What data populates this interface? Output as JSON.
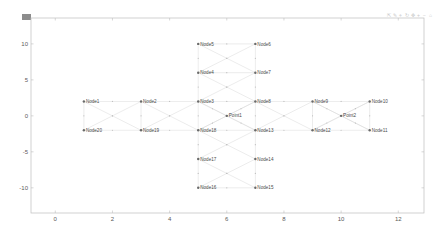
{
  "figure": {
    "grip_label": "",
    "toolbar": [
      {
        "icon": "export-icon",
        "glyph": "⇱"
      },
      {
        "icon": "brush-icon",
        "glyph": "✎"
      },
      {
        "icon": "datatip-icon",
        "glyph": "⌖"
      },
      {
        "icon": "rotate-icon",
        "glyph": "↻"
      },
      {
        "icon": "pan-icon",
        "glyph": "✥"
      },
      {
        "icon": "zoom-in-icon",
        "glyph": "+"
      },
      {
        "icon": "zoom-out-icon",
        "glyph": "−"
      },
      {
        "icon": "home-icon",
        "glyph": "⌂"
      }
    ]
  },
  "chart_data": {
    "type": "scatter",
    "subtype": "graph-network",
    "title": "",
    "xlabel": "",
    "ylabel": "",
    "xlim": [
      -0.85,
      12.9
    ],
    "ylim": [
      -13.5,
      13.6
    ],
    "xticks": [
      0,
      2,
      4,
      6,
      8,
      10,
      12
    ],
    "yticks": [
      10,
      5,
      0,
      -5,
      -10
    ],
    "xtick_labels": [
      "0",
      "2",
      "4",
      "6",
      "8",
      "10",
      "12"
    ],
    "ytick_labels": [
      "10",
      "5",
      "0",
      "-5",
      "-10"
    ],
    "grid": false,
    "legend": null,
    "nodes": [
      {
        "name": "Node1",
        "x": 1,
        "y": 2
      },
      {
        "name": "Node20",
        "x": 1,
        "y": -2
      },
      {
        "name": "Node2",
        "x": 3,
        "y": 2
      },
      {
        "name": "Node19",
        "x": 3,
        "y": -2
      },
      {
        "name": "Node3",
        "x": 5,
        "y": 2
      },
      {
        "name": "Node18",
        "x": 5,
        "y": -2
      },
      {
        "name": "Node4",
        "x": 5,
        "y": 6
      },
      {
        "name": "Node5",
        "x": 5,
        "y": 10
      },
      {
        "name": "Node6",
        "x": 7,
        "y": 10
      },
      {
        "name": "Node7",
        "x": 7,
        "y": 6
      },
      {
        "name": "Node8",
        "x": 7,
        "y": 2
      },
      {
        "name": "Node13",
        "x": 7,
        "y": -2
      },
      {
        "name": "Point1",
        "x": 6,
        "y": 0
      },
      {
        "name": "Node17",
        "x": 5,
        "y": -6
      },
      {
        "name": "Node16",
        "x": 5,
        "y": -10
      },
      {
        "name": "Node14",
        "x": 7,
        "y": -6
      },
      {
        "name": "Node15",
        "x": 7,
        "y": -10
      },
      {
        "name": "Node9",
        "x": 9,
        "y": 2
      },
      {
        "name": "Node12",
        "x": 9,
        "y": -2
      },
      {
        "name": "Point2",
        "x": 10,
        "y": 0
      },
      {
        "name": "Node10",
        "x": 11,
        "y": 2
      },
      {
        "name": "Node11",
        "x": 11,
        "y": -2
      }
    ],
    "edges": [
      [
        "Node1",
        "Node20"
      ],
      [
        "Node1",
        "Node2"
      ],
      [
        "Node1",
        "Node19"
      ],
      [
        "Node20",
        "Node2"
      ],
      [
        "Node20",
        "Node19"
      ],
      [
        "Node2",
        "Node19"
      ],
      [
        "Node2",
        "Node3"
      ],
      [
        "Node2",
        "Node18"
      ],
      [
        "Node19",
        "Node3"
      ],
      [
        "Node19",
        "Node18"
      ],
      [
        "Node3",
        "Node18"
      ],
      [
        "Node3",
        "Node4"
      ],
      [
        "Node3",
        "Node7"
      ],
      [
        "Node3",
        "Node8"
      ],
      [
        "Node3",
        "Point1"
      ],
      [
        "Node4",
        "Node5"
      ],
      [
        "Node4",
        "Node6"
      ],
      [
        "Node4",
        "Node7"
      ],
      [
        "Node4",
        "Node8"
      ],
      [
        "Node5",
        "Node6"
      ],
      [
        "Node5",
        "Node7"
      ],
      [
        "Node6",
        "Node7"
      ],
      [
        "Node7",
        "Node8"
      ],
      [
        "Node8",
        "Point1"
      ],
      [
        "Node8",
        "Node13"
      ],
      [
        "Node8",
        "Node18"
      ],
      [
        "Node8",
        "Node9"
      ],
      [
        "Node8",
        "Node12"
      ],
      [
        "Node18",
        "Point1"
      ],
      [
        "Node13",
        "Point1"
      ],
      [
        "Node18",
        "Node13"
      ],
      [
        "Node3",
        "Node13"
      ],
      [
        "Node18",
        "Node17"
      ],
      [
        "Node18",
        "Node14"
      ],
      [
        "Node13",
        "Node17"
      ],
      [
        "Node13",
        "Node14"
      ],
      [
        "Node17",
        "Node16"
      ],
      [
        "Node17",
        "Node15"
      ],
      [
        "Node14",
        "Node16"
      ],
      [
        "Node14",
        "Node15"
      ],
      [
        "Node16",
        "Node15"
      ],
      [
        "Node13",
        "Node9"
      ],
      [
        "Node13",
        "Node12"
      ],
      [
        "Node9",
        "Node12"
      ],
      [
        "Node9",
        "Point2"
      ],
      [
        "Node12",
        "Point2"
      ],
      [
        "Node9",
        "Node10"
      ],
      [
        "Node9",
        "Node11"
      ],
      [
        "Node12",
        "Node10"
      ],
      [
        "Node12",
        "Node11"
      ],
      [
        "Node10",
        "Point2"
      ],
      [
        "Node11",
        "Point2"
      ],
      [
        "Node10",
        "Node11"
      ]
    ],
    "colors": {
      "node": "#6a6a6a",
      "edge": "#d8d8d8",
      "axis": "#bdbdbd",
      "text": "#4a4a4a"
    }
  }
}
